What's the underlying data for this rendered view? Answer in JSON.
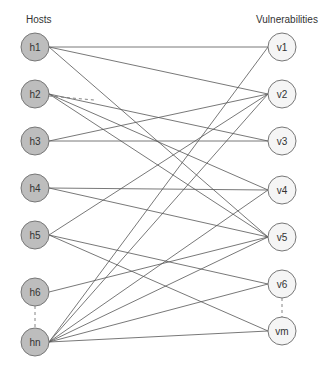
{
  "titles": {
    "hosts": "Hosts",
    "vulnerabilities": "Vulnerabilities"
  },
  "colors": {
    "host_fill": "#bdbdbd",
    "vuln_fill": "#f5f5f5",
    "edge": "#555555"
  },
  "hosts": [
    {
      "id": "h1",
      "label": "h1",
      "x": 35,
      "y": 47
    },
    {
      "id": "h2",
      "label": "h2",
      "x": 35,
      "y": 94
    },
    {
      "id": "h3",
      "label": "h3",
      "x": 35,
      "y": 141
    },
    {
      "id": "h4",
      "label": "h4",
      "x": 35,
      "y": 188
    },
    {
      "id": "h5",
      "label": "h5",
      "x": 35,
      "y": 235
    },
    {
      "id": "h6",
      "label": "h6",
      "x": 35,
      "y": 292
    },
    {
      "id": "hn",
      "label": "hn",
      "x": 35,
      "y": 342
    }
  ],
  "vulnerabilities": [
    {
      "id": "v1",
      "label": "v1",
      "x": 282,
      "y": 47
    },
    {
      "id": "v2",
      "label": "v2",
      "x": 282,
      "y": 94
    },
    {
      "id": "v3",
      "label": "v3",
      "x": 282,
      "y": 141
    },
    {
      "id": "v4",
      "label": "v4",
      "x": 282,
      "y": 190
    },
    {
      "id": "v5",
      "label": "v5",
      "x": 282,
      "y": 237
    },
    {
      "id": "v6",
      "label": "v6",
      "x": 282,
      "y": 284
    },
    {
      "id": "vm",
      "label": "vm",
      "x": 282,
      "y": 331
    }
  ],
  "edges": [
    [
      "h1",
      "v1"
    ],
    [
      "h1",
      "v2"
    ],
    [
      "h1",
      "v5"
    ],
    [
      "h2",
      "v3"
    ],
    [
      "h2",
      "v4"
    ],
    [
      "h2",
      "v5"
    ],
    [
      "h3",
      "v2"
    ],
    [
      "h3",
      "v3"
    ],
    [
      "h4",
      "v4"
    ],
    [
      "h4",
      "v5"
    ],
    [
      "h5",
      "v2"
    ],
    [
      "h5",
      "v6"
    ],
    [
      "h5",
      "vm"
    ],
    [
      "h6",
      "v5"
    ],
    [
      "hn",
      "v1"
    ],
    [
      "hn",
      "v2"
    ],
    [
      "hn",
      "v4"
    ],
    [
      "hn",
      "v5"
    ],
    [
      "hn",
      "v6"
    ],
    [
      "hn",
      "vm"
    ]
  ],
  "dashed_edges": [
    [
      "h2",
      "v2"
    ]
  ],
  "ellipsis_links": [
    [
      "h6",
      "hn"
    ],
    [
      "v6",
      "vm"
    ]
  ]
}
